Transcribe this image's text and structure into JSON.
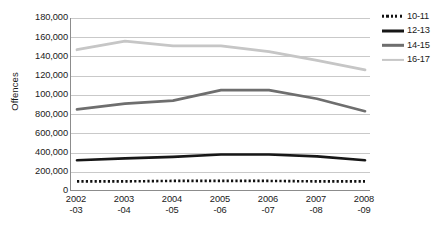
{
  "chart_data": {
    "type": "line",
    "title": "",
    "xlabel": "",
    "ylabel": "Offences",
    "grid": true,
    "legend_position": "top-right",
    "ylim": [
      0,
      180000
    ],
    "ytick_step": 20000,
    "categories": [
      "2002\n-03",
      "2003\n-04",
      "2004\n-05",
      "2005\n-06",
      "2006\n-07",
      "2007\n-08",
      "2008\n-09"
    ],
    "x_tick_labels": [
      {
        "line1": "2002",
        "line2": "-03"
      },
      {
        "line1": "2003",
        "line2": "-04"
      },
      {
        "line1": "2004",
        "line2": "-05"
      },
      {
        "line1": "2005",
        "line2": "-06"
      },
      {
        "line1": "2006",
        "line2": "-07"
      },
      {
        "line1": "2007",
        "line2": "-08"
      },
      {
        "line1": "2008",
        "line2": "-09"
      }
    ],
    "y_tick_labels": [
      {
        "value": 180000,
        "label": "180,000"
      },
      {
        "value": 160000,
        "label": "160,000"
      },
      {
        "value": 140000,
        "label": "140,000"
      },
      {
        "value": 120000,
        "label": "120,000"
      },
      {
        "value": 100000,
        "label": "100,000"
      },
      {
        "value": 80000,
        "label": "800,000"
      },
      {
        "value": 60000,
        "label": "600,000"
      },
      {
        "value": 40000,
        "label": "400,000"
      },
      {
        "value": 20000,
        "label": "200,000"
      },
      {
        "value": 0,
        "label": "0"
      }
    ],
    "series": [
      {
        "name": "10-11",
        "color": "#111111",
        "style": "dotted",
        "width": 2.6,
        "values": [
          10000,
          10000,
          10500,
          10500,
          10500,
          10000,
          10000
        ]
      },
      {
        "name": "12-13",
        "color": "#171717",
        "style": "solid",
        "width": 2.7,
        "values": [
          32000,
          34000,
          35500,
          38000,
          38000,
          36000,
          32000
        ]
      },
      {
        "name": "14-15",
        "color": "#6e6e6e",
        "style": "solid",
        "width": 2.7,
        "values": [
          85000,
          91000,
          94000,
          105000,
          105000,
          96000,
          83000
        ]
      },
      {
        "name": "16-17",
        "color": "#c6c6c6",
        "style": "solid",
        "width": 2.8,
        "values": [
          147000,
          156000,
          151000,
          151000,
          145000,
          136000,
          126000
        ]
      }
    ]
  },
  "legend": {
    "items": [
      {
        "label": "10-11",
        "color": "#111111",
        "style": "dotted",
        "width": 2.6
      },
      {
        "label": "12-13",
        "color": "#171717",
        "style": "solid",
        "width": 3.0
      },
      {
        "label": "14-15",
        "color": "#6e6e6e",
        "style": "solid",
        "width": 2.4
      },
      {
        "label": "16-17",
        "color": "#c6c6c6",
        "style": "solid",
        "width": 2.2
      }
    ]
  },
  "colors": {
    "axis": "#8c8c8c",
    "gridline": "#c9c9c9",
    "text": "#1a1a1a",
    "background": "#ffffff"
  }
}
